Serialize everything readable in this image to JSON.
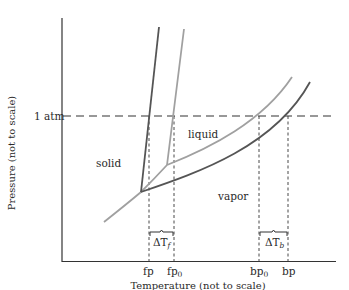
{
  "diagram": {
    "type": "phase-diagram",
    "axes": {
      "ylabel": "Pressure (not to scale)",
      "xlabel": "Temperature (not to scale)",
      "y_tick": "1 atm"
    },
    "regions": {
      "solid": "solid",
      "liquid": "liquid",
      "vapor": "vapor"
    },
    "x_ticks": {
      "fp": "fp",
      "fp0": "fp",
      "fp0_sub": "0",
      "bp0": "bp",
      "bp0_sub": "0",
      "bp": "bp"
    },
    "intervals": {
      "freezing": {
        "delta": "ΔT",
        "sub": "f"
      },
      "boiling": {
        "delta": "ΔT",
        "sub": "b"
      }
    },
    "curves": [
      {
        "name": "pure solvent",
        "color": "#9a9a9a"
      },
      {
        "name": "solution",
        "color": "#5a5a5a"
      }
    ],
    "colors": {
      "axis": "#333333",
      "pure": "#9a9a9a",
      "solution": "#555555",
      "dashed": "#333333"
    }
  }
}
